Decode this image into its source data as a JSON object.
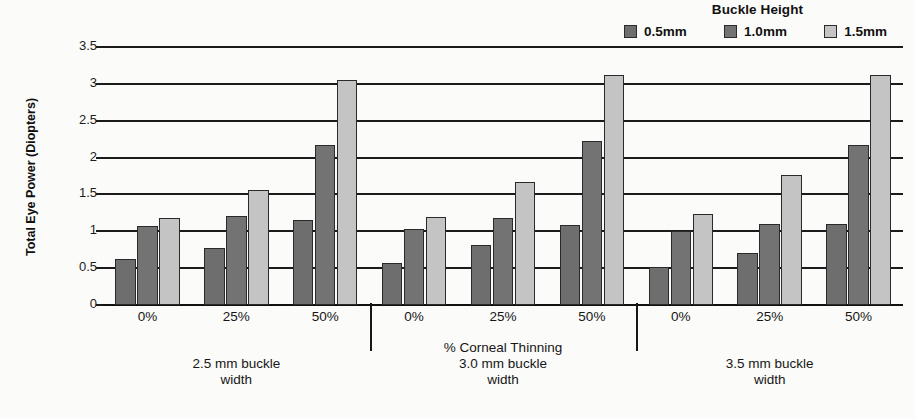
{
  "chart_data": {
    "type": "bar",
    "title": "",
    "ylabel": "Total Eye Power (Diopters)",
    "xlabel": "% Corneal Thinning",
    "ylim": [
      0,
      3.5
    ],
    "ytick_labels": [
      "3.5",
      "3",
      "2.5",
      "2",
      "1.5",
      "1",
      "0.5",
      "0"
    ],
    "ytick_values": [
      3.5,
      3,
      2.5,
      2,
      1.5,
      1,
      0.5,
      0
    ],
    "grid": true,
    "legend_position": "top-right",
    "legend_title": "Buckle Height",
    "series": [
      {
        "name": "0.5mm",
        "color": "#6e6e6e",
        "values": [
          0.62,
          0.78,
          1.16,
          0.57,
          0.82,
          1.08,
          0.52,
          0.71,
          1.1
        ]
      },
      {
        "name": "1.0mm",
        "color": "#737373",
        "values": [
          1.07,
          1.21,
          2.17,
          1.03,
          1.18,
          2.22,
          1.0,
          1.1,
          2.17
        ]
      },
      {
        "name": "1.5mm",
        "color": "#c4c4c4",
        "values": [
          1.18,
          1.56,
          3.05,
          1.19,
          1.67,
          3.12,
          1.23,
          1.76,
          3.12
        ]
      }
    ],
    "categories": [
      "0%",
      "25%",
      "50%",
      "0%",
      "25%",
      "50%",
      "0%",
      "25%",
      "50%"
    ],
    "panels": [
      {
        "caption_top": "",
        "caption_line1": "2.5 mm buckle",
        "caption_line2": "width",
        "categories": [
          "0%",
          "25%",
          "50%"
        ]
      },
      {
        "caption_top": "% Corneal Thinning",
        "caption_line1": "3.0 mm buckle",
        "caption_line2": "width",
        "categories": [
          "0%",
          "25%",
          "50%"
        ]
      },
      {
        "caption_top": "",
        "caption_line1": "3.5 mm buckle",
        "caption_line2": "width",
        "categories": [
          "0%",
          "25%",
          "50%"
        ]
      }
    ]
  },
  "legend": {
    "title": "Buckle Height",
    "items": [
      {
        "label": "0.5mm",
        "color": "#6e6e6e"
      },
      {
        "label": "1.0mm",
        "color": "#737373"
      },
      {
        "label": "1.5mm",
        "color": "#c4c4c4"
      }
    ]
  },
  "axes": {
    "y_title": "Total Eye Power (Diopters)"
  }
}
